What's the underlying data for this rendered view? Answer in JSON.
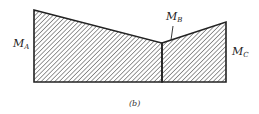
{
  "diagram": {
    "type": "moment-diagram",
    "caption": "(b)",
    "labels": {
      "ma": {
        "main": "M",
        "sub": "A"
      },
      "mb": {
        "main": "M",
        "sub": "B"
      },
      "mc": {
        "main": "M",
        "sub": "C"
      }
    },
    "colors": {
      "stroke": "#222222",
      "hatch": "#333333"
    }
  }
}
